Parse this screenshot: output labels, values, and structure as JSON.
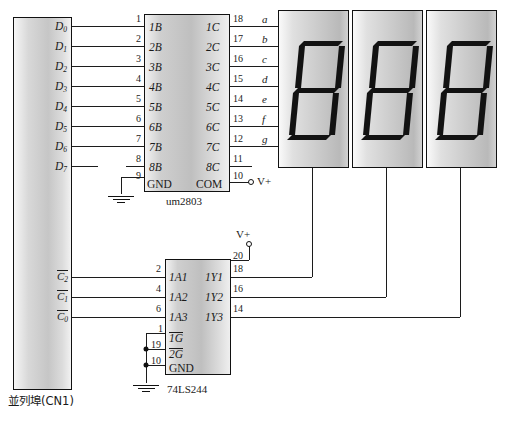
{
  "connector": {
    "name": "parallel-port-connector",
    "caption": "並列埠(CN1)",
    "data_lines": [
      {
        "label": "D",
        "sub": "0"
      },
      {
        "label": "D",
        "sub": "1"
      },
      {
        "label": "D",
        "sub": "2"
      },
      {
        "label": "D",
        "sub": "3"
      },
      {
        "label": "D",
        "sub": "4"
      },
      {
        "label": "D",
        "sub": "5"
      },
      {
        "label": "D",
        "sub": "6"
      },
      {
        "label": "D",
        "sub": "7"
      }
    ],
    "control_lines": [
      {
        "label": "C",
        "sub": "2"
      },
      {
        "label": "C",
        "sub": "1"
      },
      {
        "label": "C",
        "sub": "0"
      }
    ]
  },
  "driver_ic": {
    "name": "um2803",
    "part_label": "um2803",
    "left_pins": [
      {
        "num": "1",
        "name": "1B"
      },
      {
        "num": "2",
        "name": "2B"
      },
      {
        "num": "3",
        "name": "3B"
      },
      {
        "num": "4",
        "name": "4B"
      },
      {
        "num": "5",
        "name": "5B"
      },
      {
        "num": "6",
        "name": "6B"
      },
      {
        "num": "7",
        "name": "7B"
      },
      {
        "num": "8",
        "name": "8B"
      },
      {
        "num": "9",
        "name": "GND"
      }
    ],
    "right_pins": [
      {
        "num": "18",
        "name": "1C"
      },
      {
        "num": "17",
        "name": "2C"
      },
      {
        "num": "16",
        "name": "3C"
      },
      {
        "num": "15",
        "name": "4C"
      },
      {
        "num": "14",
        "name": "5C"
      },
      {
        "num": "13",
        "name": "6C"
      },
      {
        "num": "12",
        "name": "7C"
      },
      {
        "num": "11",
        "name": "8C"
      },
      {
        "num": "10",
        "name": "COM"
      }
    ],
    "supply_label": "V+"
  },
  "buffer_ic": {
    "name": "74LS244",
    "part_label": "74LS244",
    "vcc_pin": "20",
    "vcc_label": "V+",
    "inputs": [
      {
        "num": "2",
        "name": "1A1"
      },
      {
        "num": "4",
        "name": "1A2"
      },
      {
        "num": "6",
        "name": "1A3"
      }
    ],
    "outputs": [
      {
        "num": "18",
        "name": "1Y1"
      },
      {
        "num": "16",
        "name": "1Y2"
      },
      {
        "num": "14",
        "name": "1Y3"
      }
    ],
    "enables": [
      {
        "num": "1",
        "name": "1G",
        "overline": true
      },
      {
        "num": "19",
        "name": "2G",
        "overline": true
      },
      {
        "num": "10",
        "name": "GND",
        "overline": false
      }
    ]
  },
  "segment_bus": {
    "labels": [
      "a",
      "b",
      "c",
      "d",
      "e",
      "f",
      "g"
    ]
  },
  "displays": [
    {
      "name": "display-digit-1"
    },
    {
      "name": "display-digit-2"
    },
    {
      "name": "display-digit-3"
    }
  ],
  "colors": {
    "wire": "#1c1c1c",
    "chip_fill": "#c6c6c6",
    "outline": "#111111",
    "segment": "#121212",
    "background": "#ffffff"
  }
}
